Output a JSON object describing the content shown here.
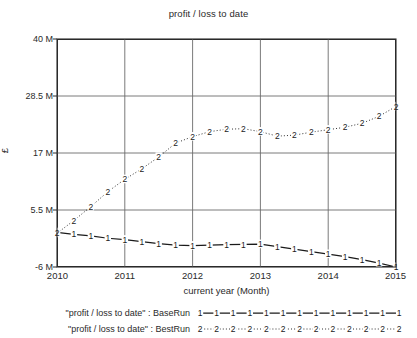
{
  "chart_data": {
    "type": "line",
    "title": "profit / loss to date",
    "xlabel": "current year (Month)",
    "ylabel": "£",
    "xlim": [
      2010,
      2015
    ],
    "ylim": [
      -6000000,
      40000000
    ],
    "grid": true,
    "legend_position": "below",
    "y_ticks": [
      {
        "value": 40000000,
        "label": "40 M"
      },
      {
        "value": 28500000,
        "label": "28.5 M"
      },
      {
        "value": 17000000,
        "label": "17 M"
      },
      {
        "value": 5500000,
        "label": "5.5 M"
      },
      {
        "value": -6000000,
        "label": "-6 M"
      }
    ],
    "x_ticks": [
      {
        "value": 2010,
        "label": "2010"
      },
      {
        "value": 2011,
        "label": "2011"
      },
      {
        "value": 2012,
        "label": "2012"
      },
      {
        "value": 2013,
        "label": "2013"
      },
      {
        "value": 2014,
        "label": "2014"
      },
      {
        "value": 2015,
        "label": "2015"
      }
    ],
    "x": [
      2010.0,
      2010.25,
      2010.5,
      2010.75,
      2011.0,
      2011.25,
      2011.5,
      2011.75,
      2012.0,
      2012.25,
      2012.5,
      2012.75,
      2013.0,
      2013.25,
      2013.5,
      2013.75,
      2014.0,
      2014.25,
      2014.5,
      2014.75,
      2015.0
    ],
    "series": [
      {
        "name": "\"profit / loss to date\" : BaseRun",
        "marker": "1",
        "line_style": "solid",
        "color": "#1a1a1a",
        "values": [
          1000000,
          600000,
          300000,
          -200000,
          -500000,
          -900000,
          -1300000,
          -1600000,
          -1700000,
          -1600000,
          -1500000,
          -1450000,
          -1400000,
          -1900000,
          -2400000,
          -2900000,
          -3400000,
          -3900000,
          -4500000,
          -5200000,
          -6000000
        ]
      },
      {
        "name": "\"profit / loss to date\" : BestRun",
        "marker": "2",
        "line_style": "dotted",
        "color": "#1a1a1a",
        "values": [
          800000,
          3400000,
          6200000,
          9200000,
          11700000,
          13800000,
          16200000,
          19000000,
          20300000,
          21300000,
          21800000,
          21900000,
          21300000,
          20400000,
          20600000,
          21200000,
          21700000,
          22200000,
          23000000,
          24400000,
          26400000
        ]
      }
    ]
  }
}
